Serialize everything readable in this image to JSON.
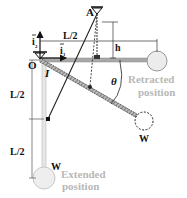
{
  "diagram": {
    "labels": {
      "point_A": "A",
      "point_O": "O",
      "unit_i1": "i",
      "unit_i1_sub": "1",
      "unit_i2": "i",
      "unit_i2_sub": "2",
      "dim_top": "L/2",
      "dim_h": "h",
      "dim_left_upper": "L/2",
      "dim_left_lower": "L/2",
      "angle": "θ",
      "inertia": "I",
      "weight_mid": "W",
      "weight_extended": "W",
      "retracted_line1": "Retracted",
      "retracted_line2": "position",
      "extended_line1": "Extended",
      "extended_line2": "position"
    },
    "colors": {
      "ink": "#111111",
      "bar_grey": "#9a9a9a",
      "faded": "#c8c8c8",
      "label_faded": "#b8b8b8"
    }
  }
}
